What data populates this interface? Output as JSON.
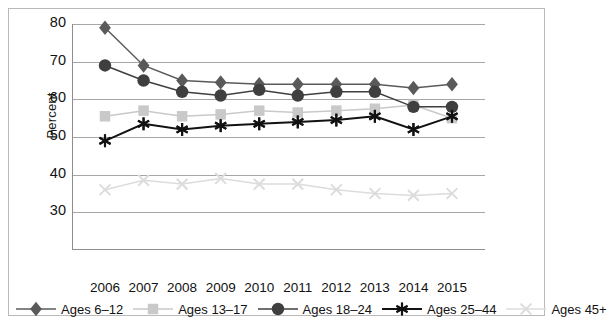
{
  "chart_data": {
    "type": "line",
    "title": "",
    "xlabel": "",
    "ylabel": "Percent",
    "categories": [
      "2006",
      "2007",
      "2008",
      "2009",
      "2010",
      "2011",
      "2012",
      "2013",
      "2014",
      "2015"
    ],
    "ylim": [
      20,
      80
    ],
    "yticks": [
      80,
      70,
      60,
      50,
      40,
      30
    ],
    "grid": true,
    "legend_position": "bottom",
    "series": [
      {
        "name": "Ages 6–12",
        "marker": "diamond",
        "color": "#5a5a5a",
        "values": [
          79,
          69,
          65,
          64.5,
          64,
          64,
          64,
          64,
          63,
          64
        ]
      },
      {
        "name": "Ages 13–17",
        "marker": "square",
        "color": "#c9c9c9",
        "values": [
          55.5,
          57,
          55.5,
          56,
          57,
          56.5,
          57,
          57.5,
          58.5,
          55
        ]
      },
      {
        "name": "Ages 18–24",
        "marker": "circle",
        "color": "#3f3f3f",
        "values": [
          69,
          65,
          62,
          61,
          62.5,
          61,
          62,
          62,
          58,
          58
        ]
      },
      {
        "name": "Ages 25–44",
        "marker": "asterisk",
        "color": "#121212",
        "values": [
          49,
          53.5,
          52,
          53,
          53.5,
          54,
          54.5,
          55.5,
          52,
          55.5
        ]
      },
      {
        "name": "Ages 45+",
        "marker": "cross",
        "color": "#dcdcdc",
        "values": [
          36,
          38.5,
          37.5,
          39,
          37.5,
          37.5,
          36,
          35,
          34.5,
          35
        ]
      }
    ]
  },
  "axis": {
    "y_label": "Percent",
    "y_tick_labels": [
      "80",
      "70",
      "60",
      "50",
      "40",
      "30"
    ],
    "x_tick_labels": [
      "2006",
      "2007",
      "2008",
      "2009",
      "2010",
      "2011",
      "2012",
      "2013",
      "2014",
      "2015"
    ]
  },
  "legend": {
    "items": [
      {
        "label": "Ages 6–12",
        "marker": "diamond",
        "color": "#5a5a5a"
      },
      {
        "label": "Ages 13–17",
        "marker": "square",
        "color": "#c9c9c9"
      },
      {
        "label": "Ages 18–24",
        "marker": "circle",
        "color": "#3f3f3f"
      },
      {
        "label": "Ages 25–44",
        "marker": "asterisk",
        "color": "#121212"
      },
      {
        "label": "Ages 45+",
        "marker": "cross",
        "color": "#dcdcdc"
      }
    ]
  }
}
